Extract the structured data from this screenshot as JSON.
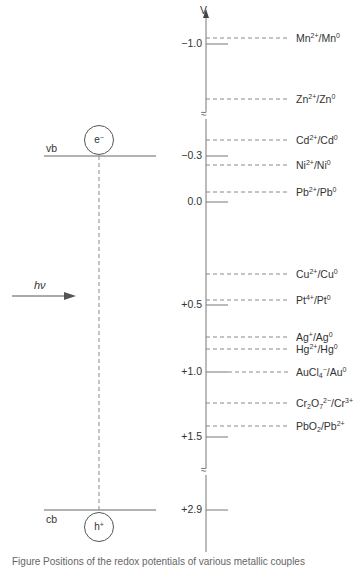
{
  "diagram": {
    "axis": {
      "label": "V",
      "ticks": [
        {
          "label": "−1.0",
          "y": 44
        },
        {
          "label": "−0.3",
          "y": 156
        },
        {
          "label": "0.0",
          "y": 202
        },
        {
          "label": "+0.5",
          "y": 305
        },
        {
          "label": "+1.0",
          "y": 372
        },
        {
          "label": "+1.5",
          "y": 437
        },
        {
          "label": "+2.9",
          "y": 510
        }
      ],
      "breaks": [
        {
          "y": 115
        },
        {
          "y": 471
        }
      ],
      "break_glyph": "≈"
    },
    "couples": [
      {
        "base": "Mn",
        "sup1": "2+",
        "mid": "/Mn",
        "sup2": "0",
        "y": 38
      },
      {
        "base": "Zn",
        "sup1": "2+",
        "mid": "/Zn",
        "sup2": "0",
        "y": 99
      },
      {
        "base": "Cd",
        "sup1": "2+",
        "mid": "/Cd",
        "sup2": "0",
        "y": 140
      },
      {
        "base": "Ni",
        "sup1": "2+",
        "mid": "/Ni",
        "sup2": "0",
        "y": 165
      },
      {
        "base": "Pb",
        "sup1": "2+",
        "mid": "/Pb",
        "sup2": "0",
        "y": 192
      },
      {
        "base": "Cu",
        "sup1": "2+",
        "mid": "/Cu",
        "sup2": "0",
        "y": 274
      },
      {
        "base": "Pt",
        "sup1": "4+",
        "mid": "/Pt",
        "sup2": "0",
        "y": 300
      },
      {
        "base": "Ag",
        "sup1": "+",
        "mid": "/Ag",
        "sup2": "0",
        "y": 337
      },
      {
        "base": "Hg",
        "sup1": "2+",
        "mid": "/Hg",
        "sup2": "0",
        "y": 349
      },
      {
        "base": "AuCl",
        "sub1": "4",
        "sup1": "−",
        "mid": "/Au",
        "sup2": "0",
        "y": 372
      },
      {
        "base": "Cr",
        "sub1": "2",
        "mid0": "O",
        "sub1b": "7",
        "sup1": "2−",
        "mid": "/Cr",
        "sup2": "3+",
        "y": 403
      },
      {
        "base": "PbO",
        "sub1": "2",
        "mid": "/Pb",
        "sup2": "2+",
        "y": 426
      }
    ],
    "semiconductor": {
      "vb_label": "vb",
      "cb_label": "cb",
      "electron": "e",
      "electron_sup": "−",
      "hole": "h",
      "hole_sup": "+",
      "photon_label": "hν"
    },
    "caption": "Figure  Positions of the redox potentials of various metallic couples"
  }
}
